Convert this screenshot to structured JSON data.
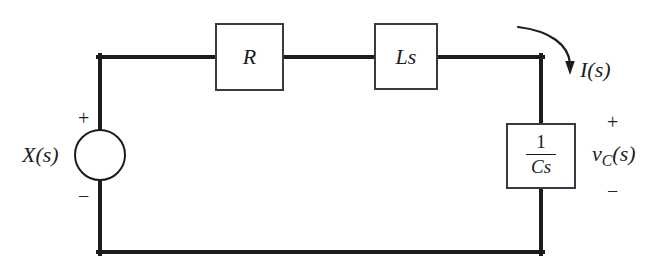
{
  "diagram": {
    "background_color": "#ffffff",
    "line_color": "#1c1c1c",
    "components": {
      "source": {
        "type": "voltage-source",
        "label": "X(s)",
        "plus_sign": "+",
        "minus_sign": "−"
      },
      "resistor": {
        "type": "impedance-block",
        "label": "R"
      },
      "inductor": {
        "type": "impedance-block",
        "label": "Ls"
      },
      "capacitor": {
        "type": "impedance-block",
        "numerator": "1",
        "denominator": "Cs"
      }
    },
    "annotations": {
      "current": {
        "label_italic": "I",
        "label_args": "(s)",
        "arrow": "curved-down-arrow"
      },
      "output_voltage": {
        "symbol": "v",
        "subscript": "C",
        "args": "(s)",
        "plus_sign": "+",
        "minus_sign": "−"
      }
    }
  }
}
